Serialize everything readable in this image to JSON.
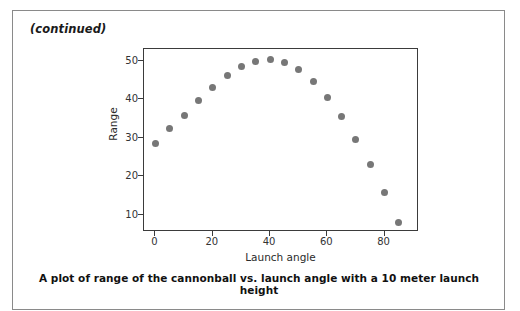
{
  "page": {
    "continued_label": "(continued)",
    "border_color": "#8a8a8a",
    "background": "#ffffff"
  },
  "figure": {
    "caption": "A plot of range of the cannonball vs. launch angle with a 10 meter launch height",
    "marker_color": "#777777",
    "axis_color": "#3b3b3b"
  },
  "chart_data": {
    "type": "scatter",
    "title": "",
    "xlabel": "Launch angle",
    "ylabel": "Range",
    "xlim": [
      -4,
      92
    ],
    "ylim": [
      5.5,
      53
    ],
    "grid": false,
    "legend": "none",
    "xticks": [
      0,
      20,
      40,
      60,
      80
    ],
    "yticks": [
      10,
      20,
      30,
      40,
      50
    ],
    "series": [
      {
        "name": "Range vs launch angle (10 m launch height)",
        "marker": "circle",
        "color": "#777777",
        "x": [
          0,
          5,
          10,
          15,
          20,
          25,
          30,
          35,
          40,
          45,
          50,
          55,
          60,
          65,
          70,
          75,
          80,
          85
        ],
        "y": [
          28.6,
          32.3,
          35.8,
          39.6,
          42.9,
          46.1,
          48.4,
          49.8,
          50.3,
          49.6,
          47.6,
          44.6,
          40.5,
          35.4,
          29.5,
          22.9,
          15.7,
          8.0
        ]
      }
    ]
  }
}
